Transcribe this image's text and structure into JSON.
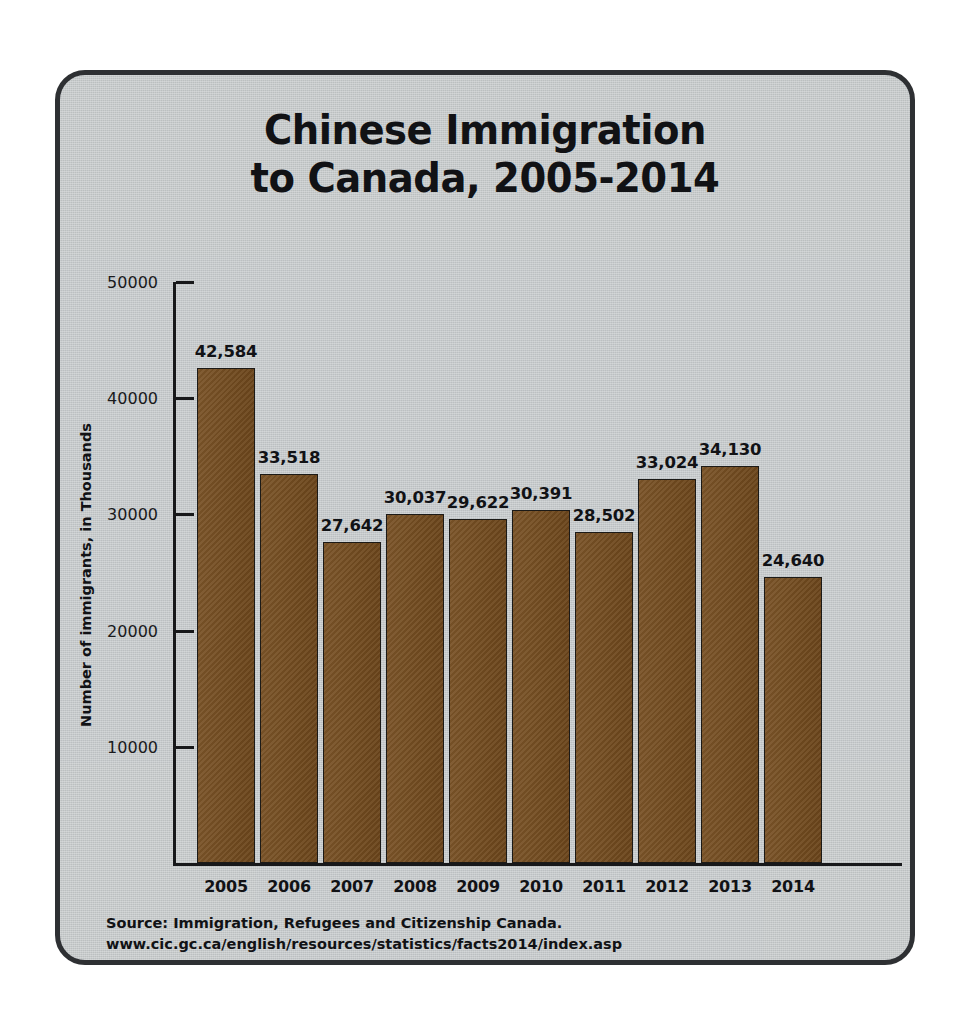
{
  "card": {
    "background_color": "#c5c9cb",
    "border_color": "#2e3033"
  },
  "title": {
    "line1": "Chinese Immigration",
    "line2": "to Canada, 2005-2014"
  },
  "axis": {
    "y_title": "Number of immigrants, in Thousands",
    "y_ticks": [
      "10000",
      "20000",
      "30000",
      "40000",
      "50000"
    ]
  },
  "source": {
    "line1": "Source: Immigration, Refugees and Citizenship Canada.",
    "line2": "www.cic.gc.ca/english/resources/statistics/facts2014/index.asp"
  },
  "chart_data": {
    "type": "bar",
    "title": "Chinese Immigration to Canada, 2005-2014",
    "subtitle": "",
    "xlabel": "",
    "ylabel": "Number of immigrants, in Thousands",
    "ylim": [
      0,
      50000
    ],
    "yticks": [
      10000,
      20000,
      30000,
      40000,
      50000
    ],
    "grid": false,
    "legend": "none",
    "bar_color": "#744b1d",
    "bar_edge_color": "#1c1a17",
    "categories": [
      "2005",
      "2006",
      "2007",
      "2008",
      "2009",
      "2010",
      "2011",
      "2012",
      "2013",
      "2014"
    ],
    "values": [
      42584,
      33518,
      27642,
      30037,
      29622,
      30391,
      28502,
      33024,
      34130,
      24640
    ],
    "value_labels": [
      "42,584",
      "33,518",
      "27,642",
      "30,037",
      "29,622",
      "30,391",
      "28,502",
      "33,024",
      "34,130",
      "24,640"
    ]
  }
}
